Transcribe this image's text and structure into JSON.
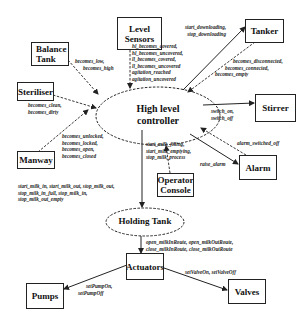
{
  "diagram": {
    "nodes": {
      "controller": {
        "label": "High level controller",
        "line1": "High level",
        "line2": "controller",
        "shape": "dashed-ellipse"
      },
      "holding_tank": {
        "label": "Holding Tank",
        "shape": "dashed-ellipse"
      },
      "level_sensors": {
        "line1": "Level",
        "line2": "Sensors"
      },
      "balance_tank": {
        "line1": "Balance",
        "line2": "Tank"
      },
      "tanker": {
        "label": "Tanker"
      },
      "steriliser": {
        "label": "Steriliser"
      },
      "stirrer": {
        "label": "Stirrer"
      },
      "manway": {
        "label": "Manway"
      },
      "operator_console": {
        "line1": "Operator",
        "line2": "Console"
      },
      "alarm": {
        "label": "Alarm"
      },
      "actuators": {
        "label": "Actuators"
      },
      "pumps": {
        "label": "Pumps"
      },
      "valves": {
        "label": "Valves"
      }
    },
    "edges": {
      "balance_tank": [
        "becomes_low,",
        "becomes_high"
      ],
      "level_sensors": [
        "hl_becomes_covered,",
        "hl_becomes_uncovered,",
        "ll_becomes_covered,",
        "ll_becomes_uncovered",
        "agitation_reached",
        "agitation_uncovered"
      ],
      "tanker_out": [
        "start_downloading,",
        "stop_downloading"
      ],
      "tanker_in": [
        "becomes_disconnected,",
        "becomes_connected,",
        "becomes_empty"
      ],
      "steriliser": [
        "becomes_clean,",
        "becomes_dirty"
      ],
      "stirrer": [
        "switch_on,",
        "switch_off"
      ],
      "alarm_in": [
        "alarm_switched_off"
      ],
      "alarm_out": [
        "raise_alarm"
      ],
      "operator_console": [
        "start_milk_filling,",
        "start_milk_emptying,",
        "stop_milk_process"
      ],
      "manway": [
        "becomes_unlocked,",
        "becomes_locked,",
        "becomes_open,",
        "becomes_closed"
      ],
      "holding_tank": [
        "start_milk_in, start_milk_out, stop_milk_out,",
        "stop_milk_in_full, stop_milk_in,",
        "stop_milk_out_empty"
      ],
      "actuators": [
        "open_milkInRoute, open_milkOutRoute,",
        "close_milkInRoute, close_milkOutRoute"
      ],
      "pumps": [
        "setPumpOn,",
        "setPumpOff"
      ],
      "valves": [
        "setValveOn, setValveOff"
      ]
    }
  }
}
